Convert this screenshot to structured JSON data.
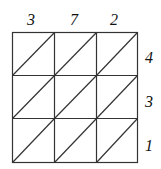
{
  "diagram": {
    "type": "lattice-multiplication-grid",
    "rows": 3,
    "cols": 3,
    "top_digits": [
      "3",
      "7",
      "2"
    ],
    "right_digits": [
      "4",
      "3",
      "1"
    ],
    "line_color": "#333333",
    "text_color": "#111111"
  }
}
